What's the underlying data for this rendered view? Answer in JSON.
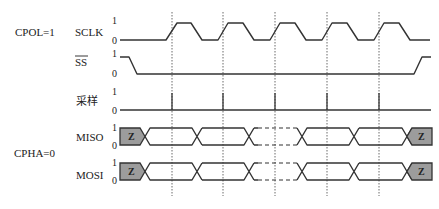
{
  "diagram": {
    "type": "SPI timing diagram",
    "mode_labels": {
      "cpol": "CPOL=1",
      "cpha": "CPHA=0"
    },
    "signals": [
      {
        "id": "sclk",
        "label": "SCLK",
        "overline": false,
        "level_high": "1",
        "level_low": "0"
      },
      {
        "id": "ss",
        "label": "SS",
        "overline": true,
        "level_high": "1",
        "level_low": "0"
      },
      {
        "id": "sample",
        "label": "采样",
        "overline": false,
        "level_high": "1",
        "level_low": "0"
      },
      {
        "id": "miso",
        "label": "MISO",
        "overline": false,
        "level_high": "1",
        "level_low": "0",
        "idle_state": "Z"
      },
      {
        "id": "mosi",
        "label": "MOSI",
        "overline": false,
        "level_high": "1",
        "level_low": "0",
        "idle_state": "Z"
      }
    ],
    "sample_edges_x": [
      172,
      223,
      275,
      327,
      379
    ],
    "colors": {
      "line": "#333333",
      "high_z_fill": "#9c9c9c",
      "background": "#ffffff"
    }
  }
}
